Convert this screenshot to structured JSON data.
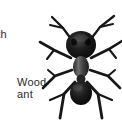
{
  "figure": {
    "background_color": "#ffffff",
    "ink_color": "#171717",
    "text_color": "#2b2b2b"
  },
  "labels": {
    "clipped_label": {
      "text": "oth",
      "full_word_hint": "moth",
      "clipped_at": "left-edge"
    },
    "wood_ant": {
      "line1": "Wood",
      "line2": "ant"
    }
  },
  "illustration": {
    "subject": "wood-ant",
    "view": "dorsal-top-down",
    "style": "halftone-photographic-cutout",
    "parts": [
      "antennae",
      "head",
      "eyes",
      "mandibles",
      "thorax",
      "petiole",
      "gaster",
      "legs"
    ],
    "leg_count": 6,
    "antenna_count": 2
  }
}
